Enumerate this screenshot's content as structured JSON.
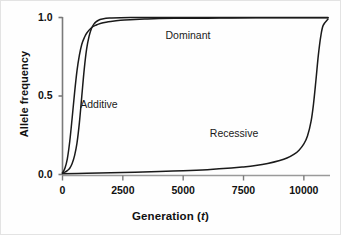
{
  "chart_data": {
    "type": "line",
    "title": "",
    "xlabel": "Generation (t)",
    "xlabel_plain": "Generation",
    "xlabel_italic_var": "t",
    "ylabel": "Allele frequency",
    "xlim": [
      0,
      11000
    ],
    "ylim": [
      0.0,
      1.0
    ],
    "grid": false,
    "legend_position": "inline-annotations",
    "xticks": [
      0,
      2500,
      5000,
      7500,
      10000
    ],
    "xtick_labels": [
      "0",
      "2500",
      "5000",
      "7500",
      "10000"
    ],
    "yticks": [
      0.0,
      0.5,
      1.0
    ],
    "ytick_labels": [
      "0.0",
      "0.5",
      "1.0"
    ],
    "line_color": "#1a1a1a",
    "axis_color": "#7a7a7a",
    "series": [
      {
        "name": "Dominant",
        "label_x": 5200,
        "label_y": 0.88,
        "x": [
          0,
          100,
          200,
          300,
          400,
          500,
          600,
          700,
          800,
          900,
          1000,
          1200,
          1400,
          1600,
          1800,
          2000,
          2400,
          2800,
          3400,
          4000,
          5000,
          6000,
          7000,
          8000,
          9000,
          10000,
          11000
        ],
        "values": [
          0.01,
          0.04,
          0.1,
          0.21,
          0.36,
          0.52,
          0.66,
          0.76,
          0.83,
          0.87,
          0.9,
          0.935,
          0.952,
          0.963,
          0.97,
          0.975,
          0.982,
          0.986,
          0.99,
          0.993,
          0.995,
          0.996,
          0.997,
          0.998,
          0.998,
          0.999,
          0.999
        ]
      },
      {
        "name": "Additive",
        "label_x": 1500,
        "label_y": 0.44,
        "x": [
          0,
          100,
          200,
          300,
          400,
          500,
          600,
          700,
          800,
          900,
          1000,
          1100,
          1200,
          1300,
          1400,
          1500,
          1600,
          1800,
          2000,
          2400,
          3000,
          4000,
          5000,
          7000,
          9000,
          11000
        ],
        "values": [
          0.01,
          0.015,
          0.025,
          0.04,
          0.07,
          0.12,
          0.2,
          0.33,
          0.5,
          0.67,
          0.8,
          0.88,
          0.93,
          0.958,
          0.974,
          0.983,
          0.989,
          0.995,
          0.997,
          0.999,
          0.9995,
          0.9998,
          0.9999,
          1.0,
          1.0,
          1.0
        ]
      },
      {
        "name": "Recessive",
        "label_x": 7100,
        "label_y": 0.26,
        "x": [
          0,
          1000,
          2000,
          3000,
          4000,
          5000,
          6000,
          7000,
          7500,
          8000,
          8500,
          9000,
          9300,
          9600,
          9800,
          10000,
          10150,
          10300,
          10400,
          10500,
          10600,
          10700,
          10800,
          11000
        ],
        "values": [
          0.005,
          0.008,
          0.011,
          0.015,
          0.019,
          0.024,
          0.031,
          0.041,
          0.048,
          0.057,
          0.07,
          0.089,
          0.105,
          0.13,
          0.155,
          0.195,
          0.245,
          0.34,
          0.45,
          0.6,
          0.76,
          0.88,
          0.95,
          0.99
        ]
      }
    ]
  },
  "annotations": {
    "dominant": "Dominant",
    "additive": "Additive",
    "recessive": "Recessive"
  }
}
